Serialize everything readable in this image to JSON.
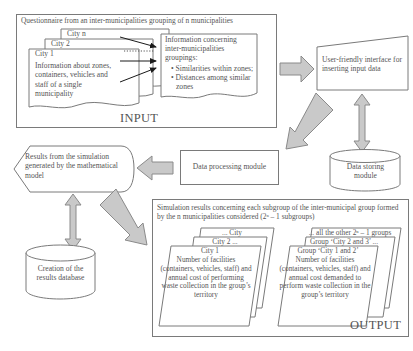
{
  "diagram": {
    "colors": {
      "arrow_fill": "#c9c9c9",
      "arrow_stroke": "#8a8a8a",
      "box_stroke": "#7a7a7a",
      "text": "#555555"
    }
  },
  "input_panel": {
    "name": "INPUT",
    "header": "Questionnaire from an inter-municipalities grouping of n municipalities",
    "cards": [
      {
        "title": "City n"
      },
      {
        "title": "City 2"
      },
      {
        "title": "City 1",
        "body": "Information about zones, containers, vehicles and staff of a single municipality"
      }
    ],
    "info_box": {
      "heading": "Information concerning inter-municipalities groupings:",
      "bullets": [
        "Similarities within zones;",
        "Distances among similar zones"
      ]
    },
    "label": "INPUT"
  },
  "interface_box": {
    "label": "User-friendly interface for inserting input data"
  },
  "data_processing": {
    "label": "Data processing module"
  },
  "data_storing": {
    "label": "Data storing module"
  },
  "results_shape": {
    "label": "Results from the simulation generated by the mathematical model"
  },
  "database_shape": {
    "label": "Creation of the results database"
  },
  "output_panel": {
    "name": "OUTPUT",
    "header": "Simulation results concerning each subgroup of the inter-municipal group formed by the n municipalities considered  (2ⁿ – 1 subgroups)",
    "left_stack": [
      {
        "title": "... City"
      },
      {
        "title": "City 2 ..."
      },
      {
        "title": "City 1",
        "body": "Number of facilities (containers, vehicles, staff) and annual cost of performing waste collection in the group’s territory"
      }
    ],
    "right_stack": [
      {
        "title": "... all the other 2ⁿ – 1 groups"
      },
      {
        "title": "Group ‘City 2 and 3’ ..."
      },
      {
        "title": "Group ‘City 1 and 2’",
        "body": "Number of facilities (containers, vehicles, staff) and annual cost demanded to perform waste collection in the group’s territory"
      }
    ],
    "label": "OUTPUT"
  }
}
